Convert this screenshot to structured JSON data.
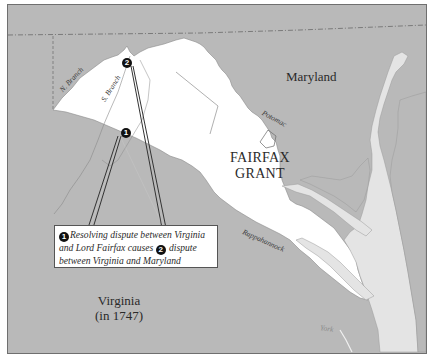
{
  "map": {
    "colors": {
      "land_outside": "#b9b9b9",
      "fairfax_grant": "#ffffff",
      "water": "#e4e4e4",
      "border": "#6f6f6f",
      "callout_line": "#333333"
    },
    "labels": {
      "maryland": "Maryland",
      "fairfax_grant_line1": "FAIRFAX",
      "fairfax_grant_line2": "GRANT",
      "virginia_line1": "Virginia",
      "virginia_line2": "(in 1747)"
    },
    "rivers": {
      "n_branch": "N. Branch",
      "s_branch": "S. Branch",
      "potomac": "Potomac",
      "rappahannock": "Rappahannock",
      "york": "York"
    },
    "markers": [
      {
        "number": "1",
        "icon": "numbered-marker-icon"
      },
      {
        "number": "2",
        "icon": "numbered-marker-icon"
      }
    ],
    "callout": {
      "marker1": "1",
      "text_part1": "Resolving dispute between Virginia and Lord Fairfax causes ",
      "marker2": "2",
      "text_part2": " dispute between Virginia and Maryland"
    }
  }
}
